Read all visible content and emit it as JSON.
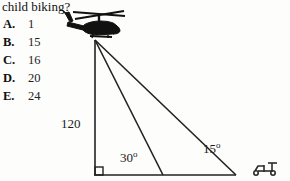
{
  "question": {
    "stem_text": "child biking?",
    "choices": [
      {
        "letter": "A.",
        "value": "1"
      },
      {
        "letter": "B.",
        "value": "15"
      },
      {
        "letter": "C.",
        "value": "16"
      },
      {
        "letter": "D.",
        "value": "20"
      },
      {
        "letter": "E.",
        "value": "24"
      }
    ]
  },
  "figure": {
    "height_label": "120",
    "angle_near_label": "30",
    "angle_near_superscript": "o",
    "angle_far_label": "15",
    "angle_far_superscript": "o",
    "icons": {
      "helicopter": "helicopter-icon",
      "right_angle": "right-angle-marker-icon",
      "cyclist": "cyclist-icon"
    },
    "colors": {
      "ink": "#1b1b1b",
      "line": "#222222",
      "background": "#fdfdfc"
    }
  }
}
